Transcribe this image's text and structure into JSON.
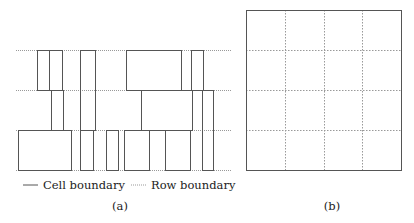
{
  "figure": {
    "panel_a": {
      "caption": "(a)",
      "row_boundaries_y": [
        50,
        90,
        130,
        170
      ],
      "row_line_x": [
        16,
        232
      ],
      "cells": [
        {
          "x": 37,
          "y": 50,
          "w": 12,
          "h": 40
        },
        {
          "x": 49,
          "y": 50,
          "w": 13,
          "h": 40
        },
        {
          "x": 80,
          "y": 50,
          "w": 15,
          "h": 80
        },
        {
          "x": 126,
          "y": 50,
          "w": 55,
          "h": 40
        },
        {
          "x": 191,
          "y": 50,
          "w": 12,
          "h": 40
        },
        {
          "x": 51,
          "y": 90,
          "w": 12,
          "h": 40
        },
        {
          "x": 141,
          "y": 90,
          "w": 51,
          "h": 40
        },
        {
          "x": 202,
          "y": 90,
          "w": 11,
          "h": 80
        },
        {
          "x": 18,
          "y": 130,
          "w": 53,
          "h": 40
        },
        {
          "x": 80,
          "y": 130,
          "w": 13,
          "h": 40
        },
        {
          "x": 106,
          "y": 130,
          "w": 12,
          "h": 40
        },
        {
          "x": 124,
          "y": 130,
          "w": 25,
          "h": 40
        },
        {
          "x": 165,
          "y": 130,
          "w": 25,
          "h": 40
        }
      ],
      "legend": {
        "cell_label": "Cell boundary",
        "row_label": "Row boundary"
      }
    },
    "panel_b": {
      "caption": "(b)",
      "outer": {
        "x": 246,
        "y": 10,
        "w": 155,
        "h": 160
      },
      "grid_cols": 4,
      "grid_rows": 4
    },
    "colors": {
      "cell_stroke": "#555555",
      "row_stroke": "#999999"
    }
  }
}
